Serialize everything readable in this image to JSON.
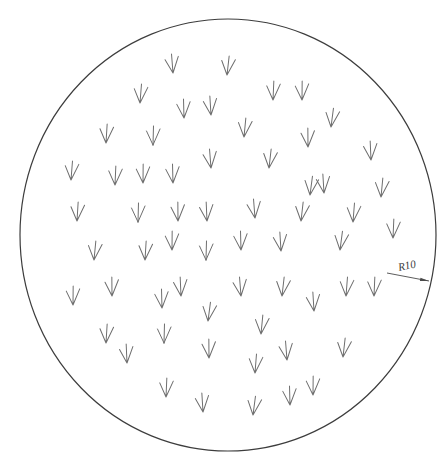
{
  "drawing": {
    "canvas": {
      "width": 447,
      "height": 459,
      "background": "#ffffff"
    },
    "outline": {
      "shape": "circle",
      "cx": 228,
      "cy": 235,
      "rx": 208,
      "ry": 216,
      "stroke_color": "#3d3d3d",
      "stroke_width": 1.2
    },
    "dimension": {
      "label": "R10",
      "label_x": 399,
      "label_y": 271,
      "label_rotation": -12,
      "label_color": "#3a3a3a",
      "leader": {
        "x1": 387,
        "y1": 273,
        "x2": 429,
        "y2": 281,
        "color": "#4a4a4a",
        "width": 0.9
      },
      "arrowhead": {
        "length": 9,
        "half_width": 1.6,
        "color": "#4a4a4a"
      }
    },
    "symbol_style": {
      "name": "grass-arrow-down",
      "color": "#6e6e6e",
      "stroke_width": 1,
      "stem_top": [
        0.5,
        -19
      ],
      "left_arm": [
        -6.5,
        -14
      ],
      "right_arm": [
        7,
        -16
      ]
    },
    "symbols": [
      {
        "x": 173,
        "y": 73
      },
      {
        "x": 227,
        "y": 75
      },
      {
        "x": 140,
        "y": 103
      },
      {
        "x": 273,
        "y": 100
      },
      {
        "x": 302,
        "y": 100
      },
      {
        "x": 184,
        "y": 118
      },
      {
        "x": 211,
        "y": 115
      },
      {
        "x": 331,
        "y": 127
      },
      {
        "x": 244,
        "y": 137
      },
      {
        "x": 106,
        "y": 143
      },
      {
        "x": 153,
        "y": 145
      },
      {
        "x": 308,
        "y": 147
      },
      {
        "x": 371,
        "y": 160
      },
      {
        "x": 211,
        "y": 168
      },
      {
        "x": 269,
        "y": 168
      },
      {
        "x": 71,
        "y": 180
      },
      {
        "x": 115,
        "y": 185
      },
      {
        "x": 143,
        "y": 183
      },
      {
        "x": 173,
        "y": 183
      },
      {
        "x": 324,
        "y": 193
      },
      {
        "x": 310,
        "y": 195
      },
      {
        "x": 381,
        "y": 197
      },
      {
        "x": 77,
        "y": 221
      },
      {
        "x": 138,
        "y": 222
      },
      {
        "x": 178,
        "y": 221
      },
      {
        "x": 207,
        "y": 221
      },
      {
        "x": 255,
        "y": 218
      },
      {
        "x": 301,
        "y": 221
      },
      {
        "x": 353,
        "y": 222
      },
      {
        "x": 393,
        "y": 238
      },
      {
        "x": 172,
        "y": 250
      },
      {
        "x": 241,
        "y": 250
      },
      {
        "x": 281,
        "y": 251
      },
      {
        "x": 340,
        "y": 250
      },
      {
        "x": 94,
        "y": 260
      },
      {
        "x": 145,
        "y": 260
      },
      {
        "x": 206,
        "y": 260
      },
      {
        "x": 112,
        "y": 296
      },
      {
        "x": 181,
        "y": 296
      },
      {
        "x": 241,
        "y": 296
      },
      {
        "x": 282,
        "y": 296
      },
      {
        "x": 346,
        "y": 296
      },
      {
        "x": 374,
        "y": 296
      },
      {
        "x": 73,
        "y": 305
      },
      {
        "x": 162,
        "y": 308
      },
      {
        "x": 314,
        "y": 311
      },
      {
        "x": 208,
        "y": 321
      },
      {
        "x": 261,
        "y": 334
      },
      {
        "x": 106,
        "y": 343
      },
      {
        "x": 164,
        "y": 343
      },
      {
        "x": 209,
        "y": 358
      },
      {
        "x": 127,
        "y": 363
      },
      {
        "x": 287,
        "y": 360
      },
      {
        "x": 343,
        "y": 357
      },
      {
        "x": 255,
        "y": 373
      },
      {
        "x": 166,
        "y": 397
      },
      {
        "x": 313,
        "y": 395
      },
      {
        "x": 290,
        "y": 405
      },
      {
        "x": 203,
        "y": 412
      },
      {
        "x": 253,
        "y": 415
      }
    ]
  }
}
